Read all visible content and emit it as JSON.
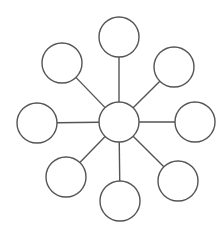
{
  "diagram": {
    "type": "hub-and-spoke",
    "stroke_color": "#555555",
    "fill_color": "#ffffff",
    "stroke_width": 1.4,
    "hub": {
      "id": "hub",
      "cx": 119,
      "cy": 122,
      "r": 20,
      "label": ""
    },
    "spokes": [
      {
        "id": "spoke-top",
        "cx": 119,
        "cy": 37,
        "r": 20,
        "label": ""
      },
      {
        "id": "spoke-top-right",
        "cx": 174,
        "cy": 67,
        "r": 20,
        "label": ""
      },
      {
        "id": "spoke-right",
        "cx": 195,
        "cy": 122,
        "r": 20,
        "label": ""
      },
      {
        "id": "spoke-bottom-right",
        "cx": 178,
        "cy": 181,
        "r": 20,
        "label": ""
      },
      {
        "id": "spoke-bottom",
        "cx": 120,
        "cy": 201,
        "r": 20,
        "label": ""
      },
      {
        "id": "spoke-bottom-left",
        "cx": 66,
        "cy": 177,
        "r": 20,
        "label": ""
      },
      {
        "id": "spoke-left",
        "cx": 37,
        "cy": 123,
        "r": 20,
        "label": ""
      },
      {
        "id": "spoke-top-left",
        "cx": 62,
        "cy": 63,
        "r": 20,
        "label": ""
      }
    ]
  }
}
